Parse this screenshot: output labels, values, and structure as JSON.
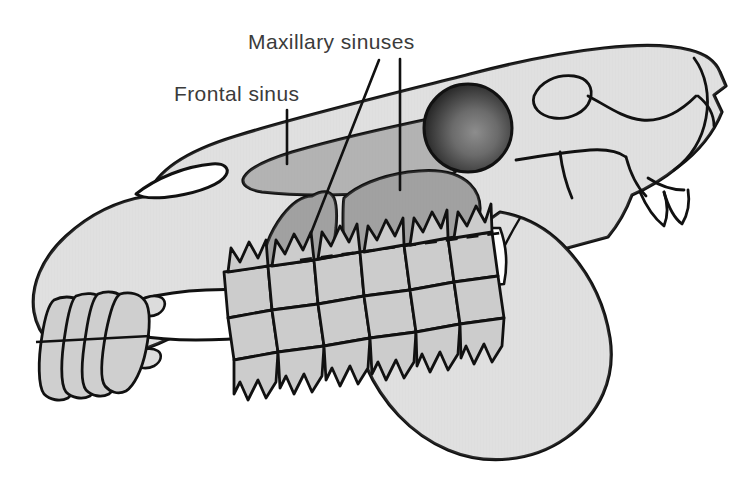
{
  "figure": {
    "view": "lateral",
    "background_color": "#ffffff"
  },
  "labels": [
    {
      "id": "maxillary",
      "text": "Maxillary sinuses",
      "x": 248,
      "y": 30,
      "font_size": 21,
      "color": "#3b3b3b"
    },
    {
      "id": "frontal",
      "text": "Frontal sinus",
      "x": 174,
      "y": 82,
      "font_size": 21,
      "color": "#3b3b3b"
    }
  ],
  "leader_lines": [
    {
      "id": "frontal-leader",
      "target": "frontal-sinus",
      "x1": 287,
      "y1": 110,
      "x2": 287,
      "y2": 164
    },
    {
      "id": "maxillary-leader-rostral",
      "target": "maxillary-sinus-rostral",
      "x1": 379,
      "y1": 60,
      "x2": 311,
      "y2": 233
    },
    {
      "id": "maxillary-leader-caudal",
      "target": "maxillary-sinus-caudal",
      "x1": 400,
      "y1": 59,
      "x2": 400,
      "y2": 190
    }
  ],
  "anatomy": {
    "regions": [
      {
        "name": "cranium-and-maxilla",
        "fill": "#dcdcdc",
        "stroke": "#111111"
      },
      {
        "name": "mandible-ramus",
        "fill": "#dcdcdc",
        "stroke": "#111111"
      },
      {
        "name": "frontal-sinus",
        "fill": "#a9a9a9",
        "stroke": "#111111"
      },
      {
        "name": "maxillary-sinus-rostral",
        "fill": "#949494",
        "stroke": "#111111"
      },
      {
        "name": "maxillary-sinus-caudal",
        "fill": "#949494",
        "stroke": "#111111"
      },
      {
        "name": "orbit",
        "fill": "#4a4a4a",
        "stroke": "#111111"
      },
      {
        "name": "cheek-teeth",
        "fill": "#cccccc",
        "stroke": "#111111"
      },
      {
        "name": "incisors",
        "fill": "#cfcfcf",
        "stroke": "#111111"
      },
      {
        "name": "diastema-gap",
        "fill": "#ffffff",
        "stroke": "#111111"
      },
      {
        "name": "reserve-crown-dashed-line",
        "stroke": "#111111",
        "style": "dashed"
      }
    ],
    "tooth_count_upper": 6,
    "tooth_count_lower": 6,
    "incisor_count": 4
  },
  "colors": {
    "paper": "#ffffff",
    "bone_light": "#dcdcdc",
    "sinus_frontal": "#a9a9a9",
    "sinus_maxillary": "#949494",
    "tooth": "#cccccc",
    "outline": "#111111",
    "orbit_dark": "#3a3a3a",
    "label_text": "#3b3b3b"
  }
}
